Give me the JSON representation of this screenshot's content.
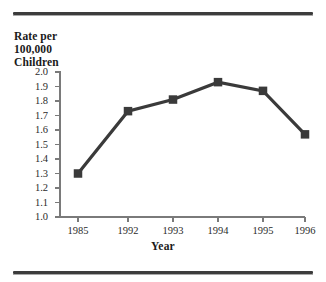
{
  "figure": {
    "name": "line-chart-figure",
    "top_rule": "divider",
    "bottom_rule": "divider"
  },
  "axis_titles": {
    "y": "Rate per\n100,000\nChildren",
    "x": "Year"
  },
  "chart_data": {
    "type": "line",
    "title": "",
    "subtitle": "",
    "xlabel": "Year",
    "ylabel": "Rate per 100,000 Children",
    "categories": [
      "1985",
      "1992",
      "1993",
      "1994",
      "1995",
      "1996"
    ],
    "values": [
      1.3,
      1.73,
      1.81,
      1.93,
      1.87,
      1.57
    ],
    "ylim": [
      1.0,
      2.0
    ],
    "ytick_labels": [
      "2.0",
      "1.9",
      "1.8",
      "1.7",
      "1.6",
      "1.5",
      "1.4",
      "1.3",
      "1.2",
      "1.1",
      "1.0"
    ],
    "ytick_values": [
      2.0,
      1.9,
      1.8,
      1.7,
      1.6,
      1.5,
      1.4,
      1.3,
      1.2,
      1.1,
      1.0
    ],
    "ytick_step": 0.1,
    "grid": false,
    "legend": false,
    "legend_position": "none",
    "marker": "filled-square",
    "line_color": "#3a3a3a",
    "marker_color": "#3a3a3a",
    "axis_color": "#7a7a7a"
  }
}
